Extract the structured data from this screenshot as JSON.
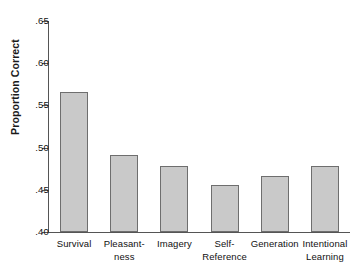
{
  "chart_data": {
    "type": "bar",
    "title": "",
    "xlabel": "",
    "ylabel": "Proportion Correct",
    "ylim": [
      0.4,
      0.65
    ],
    "yticks": [
      ".40",
      ".45",
      ".50",
      ".55",
      ".60",
      ".65"
    ],
    "ytick_values": [
      0.4,
      0.45,
      0.5,
      0.55,
      0.6,
      0.65
    ],
    "grid": false,
    "legend": null,
    "categories": [
      "Survival",
      "Pleasant-ness",
      "Imagery",
      "Self-Reference",
      "Generation",
      "Intentional Learning"
    ],
    "category_lines": [
      [
        "Survival"
      ],
      [
        "Pleasant-",
        "ness"
      ],
      [
        "Imagery"
      ],
      [
        "Self-",
        "Reference"
      ],
      [
        "Generation"
      ],
      [
        "Intentional",
        "Learning"
      ]
    ],
    "values": [
      0.566,
      0.491,
      0.478,
      0.456,
      0.466,
      0.478
    ],
    "bar_color": "#c9c9c9",
    "bar_edge_color": "#6e6e6e",
    "axis_color": "#555555",
    "background": "#ffffff"
  }
}
